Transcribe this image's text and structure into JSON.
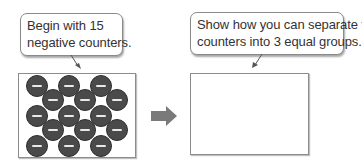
{
  "left_panel": {
    "callout": {
      "lines": [
        "Begin with 15",
        "negative counters."
      ]
    },
    "counters": {
      "count": 15,
      "sign": "negative",
      "symbol": "−",
      "color": "#4a4a4a"
    }
  },
  "arrow": {
    "icon": "right-arrow-icon",
    "color": "#7a7a7a"
  },
  "right_panel": {
    "callout": {
      "lines": [
        "Show how you can separate the",
        "counters into 3 equal groups."
      ]
    },
    "box_content": ""
  }
}
